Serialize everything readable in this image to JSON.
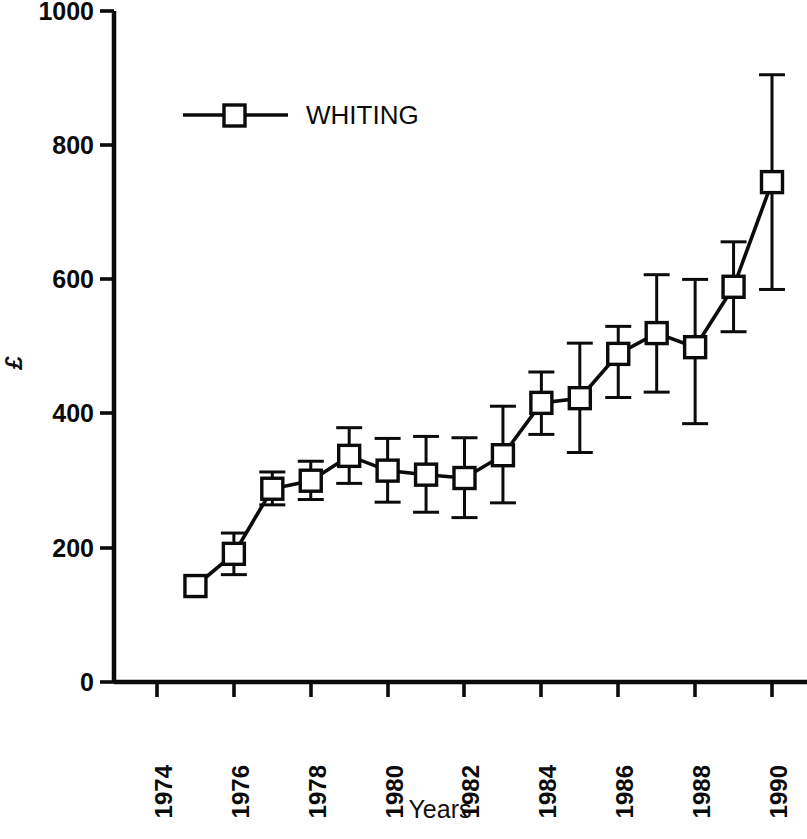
{
  "chart_data": {
    "type": "line",
    "title": "",
    "subtitle": "",
    "xlabel": "Years",
    "ylabel": "£",
    "xlim": [
      1974.0,
      1990.6
    ],
    "ylim": [
      0,
      1000
    ],
    "grid": false,
    "legend_position": "top-left-inside",
    "x_tick_labels": [
      "1974",
      "1976",
      "1978",
      "1980",
      "1982",
      "1984",
      "1986",
      "1988",
      "1990"
    ],
    "x_ticks": [
      1974,
      1976,
      1978,
      1980,
      1982,
      1984,
      1986,
      1988,
      1990
    ],
    "y_tick_labels": [
      "0",
      "200",
      "400",
      "600",
      "800",
      "1000"
    ],
    "y_ticks": [
      0,
      200,
      400,
      600,
      800,
      1000
    ],
    "x": [
      1975,
      1976,
      1977,
      1978,
      1979,
      1980,
      1981,
      1982,
      1983,
      1984,
      1985,
      1986,
      1987,
      1988,
      1989,
      1990
    ],
    "series": [
      {
        "name": "WHITING",
        "marker": "open-square",
        "color": "#0b0b0b",
        "values": [
          143,
          191,
          288,
          300,
          337,
          315,
          309,
          304,
          338,
          416,
          423,
          489,
          520,
          499,
          589,
          745
        ],
        "err_low": [
          143,
          160,
          264,
          272,
          296,
          268,
          253,
          245,
          267,
          369,
          342,
          424,
          432,
          385,
          522,
          585
        ],
        "err_high": [
          143,
          222,
          313,
          329,
          379,
          363,
          366,
          364,
          411,
          462,
          505,
          530,
          607,
          600,
          656,
          905
        ]
      }
    ],
    "legend": [
      {
        "label": "WHITING",
        "marker": "open-square"
      }
    ]
  },
  "axes": {
    "y_axis_title": "£",
    "x_axis_title": "Years"
  }
}
